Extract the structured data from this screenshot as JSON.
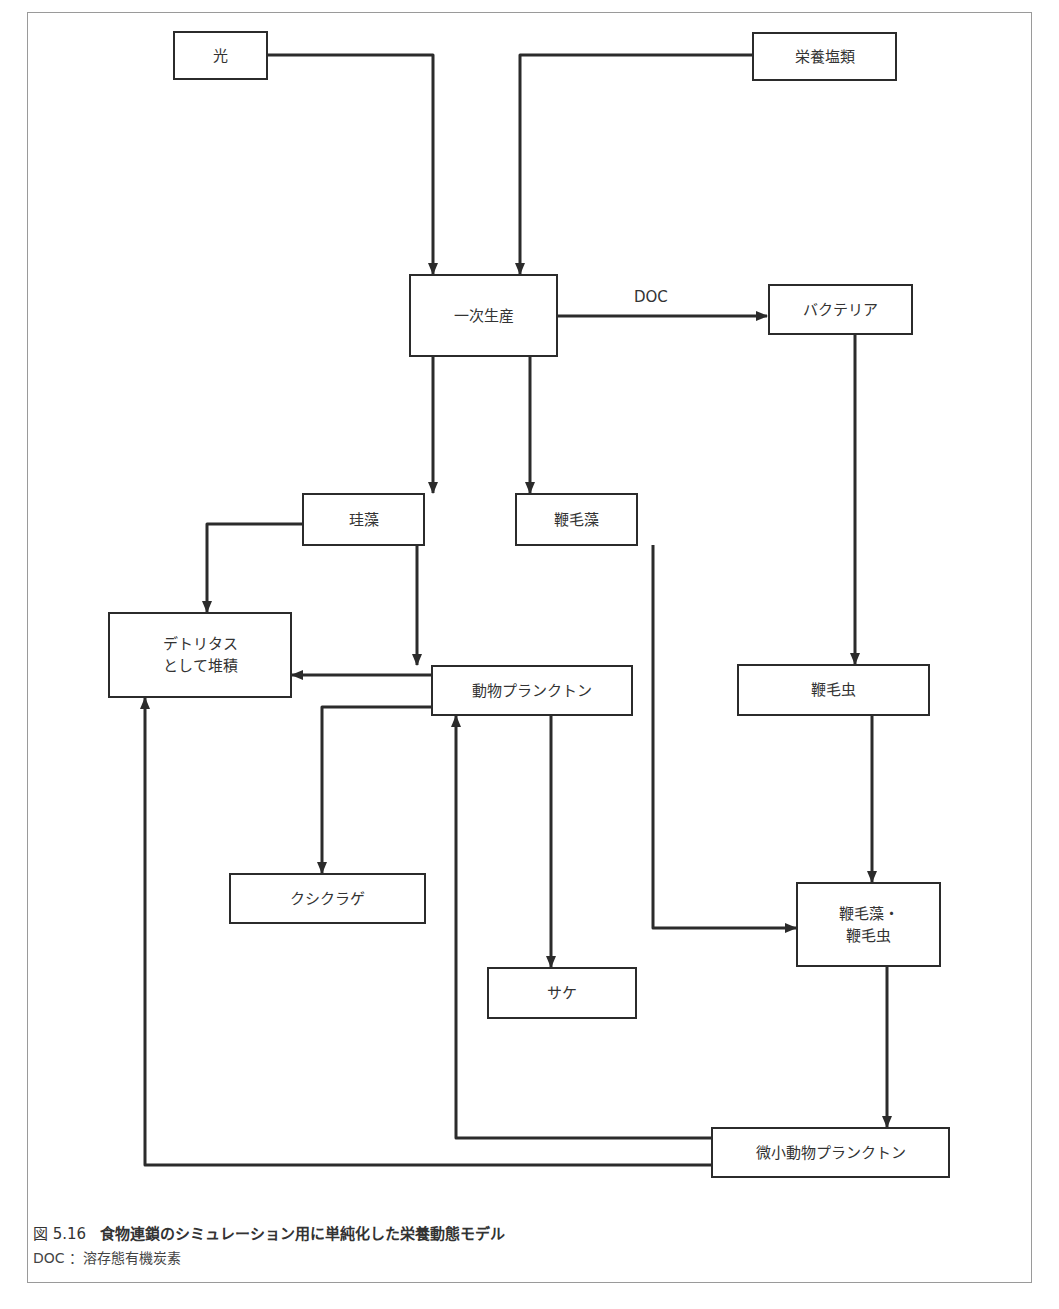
{
  "nodes": {
    "light": "光",
    "nutrients": "栄養塩類",
    "primary_production": "一次生産",
    "bacteria": "バクテリア",
    "diatoms": "珪藻",
    "dinoflagellates": "鞭毛藻",
    "detritus_line1": "デトリタス",
    "detritus_line2": "として堆積",
    "zooplankton": "動物プランクトン",
    "flagellates": "鞭毛虫",
    "ctenophore": "クシクラゲ",
    "dino_flag_line1": "鞭毛藻・",
    "dino_flag_line2": "鞭毛虫",
    "salmon": "サケ",
    "microzooplankton": "微小動物プランクトン"
  },
  "edge_labels": {
    "doc": "DOC"
  },
  "edges": [
    {
      "from": "light",
      "to": "primary_production"
    },
    {
      "from": "nutrients",
      "to": "primary_production"
    },
    {
      "from": "primary_production",
      "to": "bacteria",
      "label": "DOC"
    },
    {
      "from": "primary_production",
      "to": "diatoms"
    },
    {
      "from": "primary_production",
      "to": "dinoflagellates"
    },
    {
      "from": "diatoms",
      "to": "detritus"
    },
    {
      "from": "diatoms",
      "to": "zooplankton"
    },
    {
      "from": "zooplankton",
      "to": "detritus"
    },
    {
      "from": "zooplankton",
      "to": "ctenophore"
    },
    {
      "from": "zooplankton",
      "to": "salmon"
    },
    {
      "from": "bacteria",
      "to": "flagellates"
    },
    {
      "from": "flagellates",
      "to": "dinoflagellates_flagellates"
    },
    {
      "from": "dinoflagellates",
      "to": "dinoflagellates_flagellates"
    },
    {
      "from": "dinoflagellates_flagellates",
      "to": "microzooplankton"
    },
    {
      "from": "microzooplankton",
      "to": "zooplankton"
    },
    {
      "from": "microzooplankton",
      "to": "detritus"
    }
  ],
  "caption": {
    "figure_number": "図 5.16",
    "title": "食物連鎖のシミュレーション用に単純化した栄養動態モデル",
    "note": "DOC ：溶存態有機炭素"
  }
}
